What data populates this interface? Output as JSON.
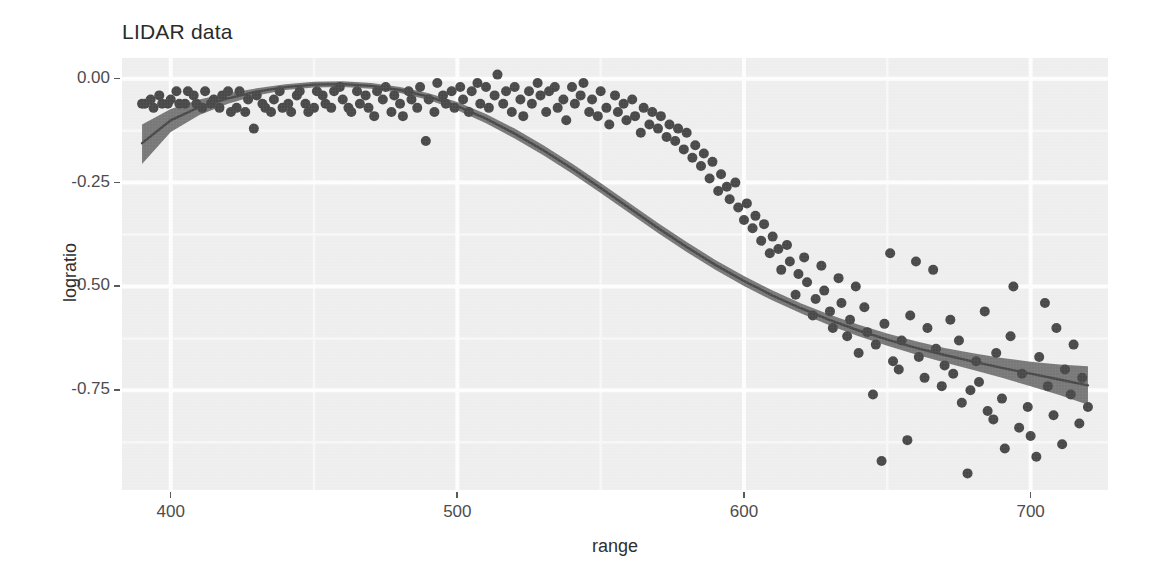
{
  "title": "LIDAR data",
  "axes": {
    "x_label": "range",
    "y_label": "logratio",
    "x_ticks": [
      "400",
      "500",
      "600",
      "700"
    ],
    "y_ticks": [
      "0.00",
      "-0.25",
      "-0.50",
      "-0.75"
    ]
  },
  "colors": {
    "panel_background": "#ececec",
    "gridline_major": "#ffffff",
    "gridline_minor": "#f7f7f7",
    "point": "#1a1a1a",
    "smooth_line": "#1a1a1a",
    "confidence_ribbon": "#565656",
    "title_text": "#2b2b2b",
    "axis_text": "#4d4d4d"
  },
  "chart_data": {
    "type": "scatter",
    "title": "LIDAR data",
    "xlabel": "range",
    "ylabel": "logratio",
    "xlim": [
      383,
      727
    ],
    "ylim": [
      -0.99,
      0.05
    ],
    "grid": true,
    "legend": "none",
    "x_major_ticks": [
      400,
      500,
      600,
      700
    ],
    "y_major_ticks": [
      0.0,
      -0.25,
      -0.5,
      -0.75
    ],
    "x_minor_ticks": [
      450,
      550,
      650
    ],
    "y_minor_ticks": [
      -0.125,
      -0.375,
      -0.625,
      -0.875
    ],
    "point_radius_px": 5,
    "series": [
      {
        "name": "observations",
        "type": "scatter",
        "x": [
          390,
          391,
          393,
          394,
          396,
          397,
          399,
          400,
          402,
          403,
          405,
          406,
          408,
          409,
          411,
          412,
          414,
          415,
          417,
          418,
          420,
          421,
          423,
          424,
          426,
          427,
          429,
          430,
          432,
          433,
          435,
          436,
          438,
          439,
          441,
          442,
          444,
          445,
          447,
          448,
          450,
          451,
          453,
          454,
          456,
          457,
          459,
          460,
          462,
          463,
          465,
          466,
          468,
          469,
          471,
          472,
          474,
          475,
          477,
          478,
          480,
          481,
          483,
          484,
          486,
          487,
          489,
          490,
          492,
          493,
          495,
          496,
          498,
          499,
          501,
          502,
          504,
          505,
          507,
          508,
          510,
          511,
          513,
          514,
          516,
          517,
          519,
          520,
          522,
          523,
          525,
          526,
          528,
          529,
          531,
          532,
          534,
          535,
          537,
          538,
          540,
          541,
          543,
          544,
          546,
          547,
          549,
          550,
          552,
          553,
          555,
          556,
          558,
          559,
          561,
          562,
          564,
          565,
          567,
          568,
          570,
          571,
          573,
          574,
          576,
          577,
          579,
          580,
          582,
          583,
          585,
          586,
          588,
          589,
          591,
          592,
          594,
          595,
          597,
          598,
          600,
          601,
          603,
          604,
          606,
          607,
          609,
          610,
          612,
          613,
          615,
          616,
          618,
          619,
          621,
          622,
          624,
          625,
          627,
          628,
          630,
          631,
          633,
          634,
          636,
          637,
          639,
          640,
          642,
          643,
          645,
          646,
          648,
          649,
          651,
          652,
          654,
          655,
          657,
          658,
          660,
          661,
          663,
          664,
          666,
          667,
          669,
          670,
          672,
          673,
          675,
          676,
          678,
          679,
          681,
          682,
          684,
          685,
          687,
          688,
          690,
          691,
          693,
          694,
          696,
          697,
          699,
          700,
          702,
          703,
          705,
          706,
          708,
          709,
          711,
          712,
          714,
          715,
          717,
          718,
          720
        ],
        "y": [
          -0.06,
          -0.06,
          -0.05,
          -0.07,
          -0.04,
          -0.06,
          -0.06,
          -0.05,
          -0.03,
          -0.06,
          -0.06,
          -0.03,
          -0.04,
          -0.06,
          -0.07,
          -0.03,
          -0.06,
          -0.05,
          -0.07,
          -0.04,
          -0.03,
          -0.08,
          -0.07,
          -0.03,
          -0.08,
          -0.05,
          -0.12,
          -0.04,
          -0.06,
          -0.07,
          -0.08,
          -0.05,
          -0.03,
          -0.07,
          -0.06,
          -0.08,
          -0.04,
          -0.03,
          -0.06,
          -0.08,
          -0.07,
          -0.03,
          -0.04,
          -0.06,
          -0.07,
          -0.03,
          -0.02,
          -0.05,
          -0.07,
          -0.08,
          -0.03,
          -0.06,
          -0.04,
          -0.07,
          -0.09,
          -0.03,
          -0.05,
          -0.02,
          -0.08,
          -0.04,
          -0.06,
          -0.09,
          -0.03,
          -0.05,
          -0.07,
          -0.02,
          -0.15,
          -0.05,
          -0.08,
          -0.01,
          -0.04,
          -0.06,
          -0.03,
          -0.07,
          -0.02,
          -0.05,
          -0.08,
          -0.03,
          -0.01,
          -0.06,
          -0.02,
          -0.07,
          -0.04,
          0.01,
          -0.06,
          -0.03,
          -0.08,
          -0.02,
          -0.05,
          -0.09,
          -0.03,
          -0.06,
          -0.01,
          -0.04,
          -0.08,
          -0.03,
          -0.02,
          -0.07,
          -0.05,
          -0.1,
          -0.02,
          -0.06,
          -0.04,
          -0.01,
          -0.08,
          -0.05,
          -0.09,
          -0.03,
          -0.07,
          -0.11,
          -0.04,
          -0.08,
          -0.06,
          -0.1,
          -0.05,
          -0.09,
          -0.13,
          -0.07,
          -0.11,
          -0.08,
          -0.12,
          -0.09,
          -0.14,
          -0.11,
          -0.15,
          -0.12,
          -0.17,
          -0.13,
          -0.19,
          -0.16,
          -0.21,
          -0.18,
          -0.24,
          -0.2,
          -0.27,
          -0.23,
          -0.26,
          -0.29,
          -0.25,
          -0.31,
          -0.34,
          -0.3,
          -0.36,
          -0.33,
          -0.39,
          -0.35,
          -0.42,
          -0.38,
          -0.41,
          -0.46,
          -0.4,
          -0.44,
          -0.52,
          -0.47,
          -0.43,
          -0.49,
          -0.57,
          -0.53,
          -0.45,
          -0.51,
          -0.56,
          -0.6,
          -0.48,
          -0.54,
          -0.62,
          -0.58,
          -0.5,
          -0.66,
          -0.55,
          -0.61,
          -0.76,
          -0.64,
          -0.92,
          -0.59,
          -0.42,
          -0.68,
          -0.7,
          -0.63,
          -0.87,
          -0.57,
          -0.44,
          -0.67,
          -0.72,
          -0.6,
          -0.46,
          -0.65,
          -0.74,
          -0.69,
          -0.58,
          -0.71,
          -0.63,
          -0.78,
          -0.95,
          -0.75,
          -0.68,
          -0.73,
          -0.56,
          -0.8,
          -0.82,
          -0.66,
          -0.77,
          -0.89,
          -0.62,
          -0.5,
          -0.84,
          -0.71,
          -0.79,
          -0.86,
          -0.91,
          -0.67,
          -0.54,
          -0.74,
          -0.81,
          -0.6,
          -0.88,
          -0.7,
          -0.76,
          -0.64,
          -0.83,
          -0.72,
          -0.79
        ],
        "color": "#1a1a1a"
      },
      {
        "name": "smooth",
        "type": "line",
        "x": [
          390,
          400,
          410,
          420,
          430,
          440,
          450,
          460,
          470,
          480,
          490,
          500,
          510,
          520,
          530,
          540,
          550,
          560,
          570,
          580,
          590,
          600,
          610,
          620,
          630,
          640,
          650,
          660,
          670,
          680,
          690,
          700,
          710,
          720
        ],
        "y": [
          -0.155,
          -0.1,
          -0.068,
          -0.047,
          -0.031,
          -0.02,
          -0.014,
          -0.013,
          -0.017,
          -0.027,
          -0.043,
          -0.066,
          -0.096,
          -0.132,
          -0.172,
          -0.216,
          -0.263,
          -0.311,
          -0.359,
          -0.405,
          -0.448,
          -0.487,
          -0.522,
          -0.553,
          -0.581,
          -0.606,
          -0.628,
          -0.648,
          -0.665,
          -0.681,
          -0.696,
          -0.71,
          -0.724,
          -0.738
        ],
        "color": "#1a1a1a"
      },
      {
        "name": "confidence-band-upper",
        "type": "line",
        "x": [
          390,
          400,
          410,
          420,
          430,
          440,
          450,
          460,
          470,
          480,
          490,
          500,
          510,
          520,
          530,
          540,
          550,
          560,
          570,
          580,
          590,
          600,
          610,
          620,
          630,
          640,
          650,
          660,
          670,
          680,
          690,
          700,
          710,
          720
        ],
        "y": [
          -0.11,
          -0.073,
          -0.05,
          -0.035,
          -0.023,
          -0.013,
          -0.007,
          -0.006,
          -0.01,
          -0.02,
          -0.035,
          -0.056,
          -0.085,
          -0.12,
          -0.16,
          -0.204,
          -0.251,
          -0.299,
          -0.347,
          -0.393,
          -0.436,
          -0.475,
          -0.51,
          -0.541,
          -0.568,
          -0.592,
          -0.613,
          -0.632,
          -0.648,
          -0.661,
          -0.672,
          -0.681,
          -0.688,
          -0.692
        ]
      },
      {
        "name": "confidence-band-lower",
        "type": "line",
        "x": [
          390,
          400,
          410,
          420,
          430,
          440,
          450,
          460,
          470,
          480,
          490,
          500,
          510,
          520,
          530,
          540,
          550,
          560,
          570,
          580,
          590,
          600,
          610,
          620,
          630,
          640,
          650,
          660,
          670,
          680,
          690,
          700,
          710,
          720
        ],
        "y": [
          -0.205,
          -0.128,
          -0.087,
          -0.06,
          -0.04,
          -0.027,
          -0.021,
          -0.02,
          -0.024,
          -0.034,
          -0.051,
          -0.076,
          -0.107,
          -0.144,
          -0.184,
          -0.228,
          -0.275,
          -0.323,
          -0.371,
          -0.417,
          -0.46,
          -0.499,
          -0.534,
          -0.565,
          -0.594,
          -0.62,
          -0.643,
          -0.664,
          -0.683,
          -0.701,
          -0.72,
          -0.74,
          -0.761,
          -0.785
        ]
      }
    ]
  }
}
